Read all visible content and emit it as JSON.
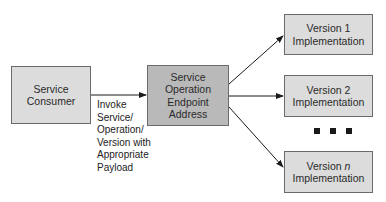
{
  "diagram": {
    "nodes": {
      "consumer": {
        "line1": "Service",
        "line2": "Consumer"
      },
      "endpoint": {
        "line1": "Service",
        "line2": "Operation",
        "line3": "Endpoint",
        "line4": "Address"
      },
      "v1": {
        "line1": "Version 1",
        "line2": "Implementation"
      },
      "v2": {
        "line1": "Version 2",
        "line2": "Implementation"
      },
      "vn": {
        "line1_prefix": "Version ",
        "line1_var": "n",
        "line2": "Implementation"
      }
    },
    "edge_label": {
      "lines": [
        "Invoke",
        "Service/",
        "Operation/",
        "Version with",
        "Appropriate",
        "Payload"
      ]
    },
    "ellipsis": "■ ■ ■",
    "colors": {
      "light_box": "#dcdcdc",
      "dark_box": "#b9b9b9",
      "border": "#6a6a6a",
      "arrow": "#1a1a1a"
    }
  }
}
